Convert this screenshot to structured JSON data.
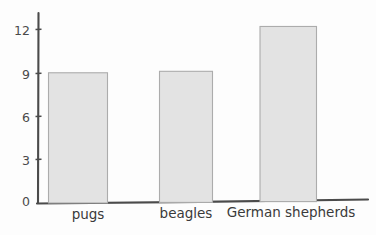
{
  "chart_data": {
    "type": "bar",
    "title": "",
    "subtitle": "",
    "xlabel": "",
    "ylabel": "",
    "categories": [
      "pugs",
      "beagles",
      "German shepherds"
    ],
    "values": [
      9,
      9.1,
      12.2
    ],
    "series": [
      {
        "name": "",
        "values": [
          9,
          9.1,
          12.2
        ]
      }
    ],
    "ylim": [
      0,
      13.2
    ],
    "yticks": [
      0,
      3,
      6,
      9,
      12
    ],
    "ytick_labels": [
      "0",
      "3",
      "6",
      "9",
      "12"
    ],
    "grid": false,
    "legend": false,
    "legend_position": "none",
    "annotations": [],
    "style": {
      "bar_fill": "#e3e3e3",
      "bar_edge": "#a8a8a8",
      "axis_color": "#4b4b4b",
      "text_color": "#3a3a3a",
      "background": "#fdfdfd",
      "hand_drawn": true
    }
  },
  "axis": {
    "y_ticks": [
      {
        "label": "12",
        "value": 12
      },
      {
        "label": "9",
        "value": 9
      },
      {
        "label": "6",
        "value": 6
      },
      {
        "label": "3",
        "value": 3
      },
      {
        "label": "0",
        "value": 0
      }
    ]
  },
  "bars": [
    {
      "label": "pugs",
      "value": 9
    },
    {
      "label": "beagles",
      "value": 9.1
    },
    {
      "label": "German shepherds",
      "value": 12.2
    }
  ]
}
